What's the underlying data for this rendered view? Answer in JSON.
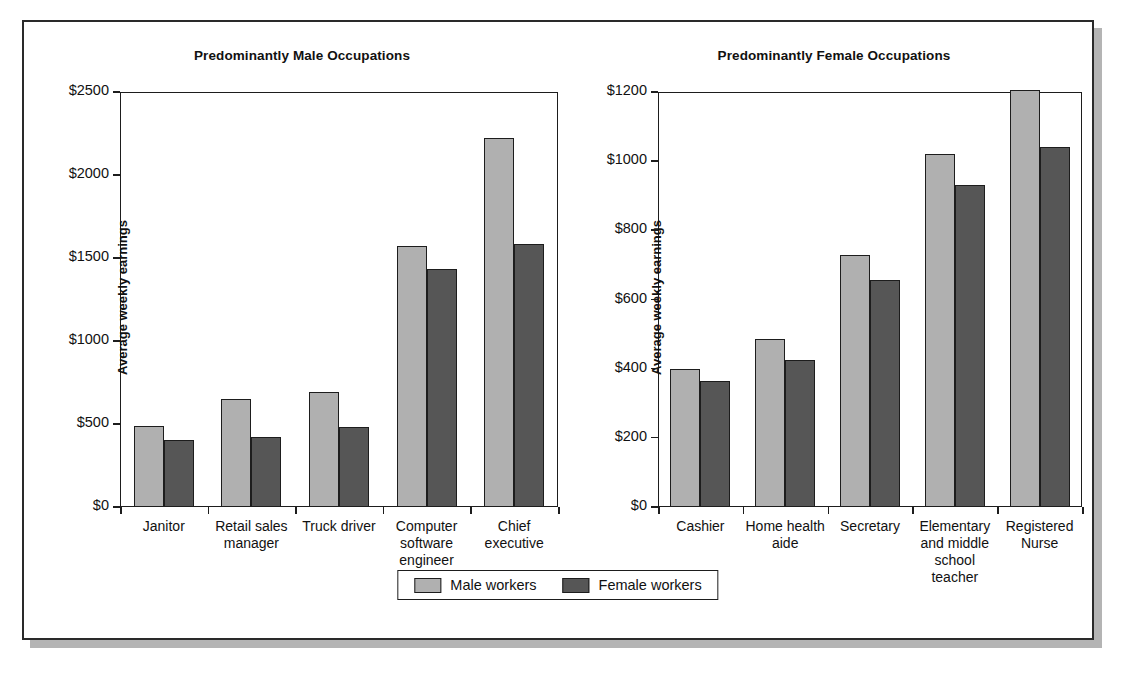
{
  "legend": {
    "items": [
      {
        "label": "Male workers",
        "color": "#b0b0b0",
        "key": "male"
      },
      {
        "label": "Female workers",
        "color": "#565656",
        "key": "female"
      }
    ]
  },
  "chart_data": [
    {
      "type": "bar",
      "id": "male-occupations",
      "title": "Predominantly Male Occupations",
      "xlabel": "",
      "ylabel": "Average weekly earnings",
      "ylim": [
        0,
        2500
      ],
      "yticks": [
        0,
        500,
        1000,
        1500,
        2000,
        2500
      ],
      "ytick_labels": [
        "$0",
        "$500",
        "$1000",
        "$1500",
        "$2000",
        "$2500"
      ],
      "grid": false,
      "legend_position": "bottom",
      "categories": [
        "Janitor",
        "Retail sales manager",
        "Truck driver",
        "Computer software engineer",
        "Chief executive"
      ],
      "series": [
        {
          "name": "Male workers",
          "values": [
            490,
            650,
            690,
            1575,
            2220
          ]
        },
        {
          "name": "Female workers",
          "values": [
            405,
            420,
            480,
            1435,
            1585
          ]
        }
      ]
    },
    {
      "type": "bar",
      "id": "female-occupations",
      "title": "Predominantly Female Occupations",
      "xlabel": "",
      "ylabel": "Average weekly earnings",
      "ylim": [
        0,
        1200
      ],
      "yticks": [
        0,
        200,
        400,
        600,
        800,
        1000,
        1200
      ],
      "ytick_labels": [
        "$0",
        "$200",
        "$400",
        "$600",
        "$800",
        "$1000",
        "$1200"
      ],
      "grid": false,
      "legend_position": "bottom",
      "categories": [
        "Cashier",
        "Home health aide",
        "Secretary",
        "Elementary and middle school teacher",
        "Registered Nurse"
      ],
      "series": [
        {
          "name": "Male workers",
          "values": [
            400,
            485,
            730,
            1020,
            1205
          ]
        },
        {
          "name": "Female workers",
          "values": [
            365,
            425,
            655,
            930,
            1040
          ]
        }
      ]
    }
  ]
}
